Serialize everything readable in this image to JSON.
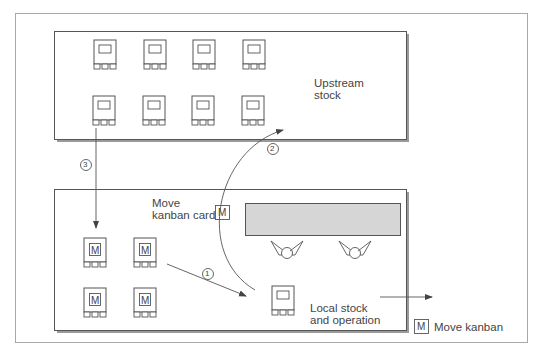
{
  "diagram": {
    "type": "kanban-flow",
    "colors": {
      "line": "#555555",
      "frame": "#a8a8a8",
      "box_shadow": "#9a9a9a",
      "operation_bar": "#d6d6d6"
    },
    "upstream": {
      "label_line1": "Upstream",
      "label_line2": "stock",
      "card_count": 8
    },
    "local": {
      "move_label_line1": "Move",
      "move_label_line2": "kanban card",
      "move_card_glyph": "M",
      "kanban_cards": [
        "M",
        "M",
        "M",
        "M"
      ],
      "stock_label_line1": "Local stock",
      "stock_label_line2": "and operation"
    },
    "steps": [
      {
        "id": "step-1",
        "label": "1"
      },
      {
        "id": "step-2",
        "label": "2"
      },
      {
        "id": "step-3",
        "label": "3"
      }
    ],
    "legend": {
      "glyph": "M",
      "label": "Move kanban"
    }
  }
}
